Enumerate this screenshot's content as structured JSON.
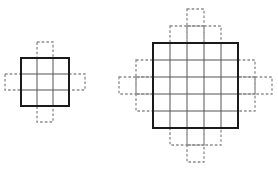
{
  "figure": {
    "title": "",
    "background_color": "#ffffff",
    "solid_border_color": "#1a1a1a",
    "interior_line_color": "#555555",
    "ghost_cell_color": "#8a8a8a",
    "ghost_dash_pattern": "2.6 2.1"
  },
  "chart_data": {
    "type": "diagram",
    "title": "",
    "panels": [
      {
        "id": "left-grid",
        "label": "",
        "grid": {
          "columns": 3,
          "rows": 3,
          "cell_size": 16,
          "origin_x": 21,
          "origin_y": 58
        },
        "ghost_cells": [
          {
            "col": 1,
            "row": -1
          },
          {
            "col": 1,
            "row": 3
          },
          {
            "col": -1,
            "row": 1
          },
          {
            "col": 3,
            "row": 1
          }
        ]
      },
      {
        "id": "right-grid",
        "label": "",
        "grid": {
          "columns": 5,
          "rows": 5,
          "cell_size": 17,
          "origin_x": 153,
          "origin_y": 43
        },
        "ghost_cells": [
          {
            "col": 1,
            "row": -1
          },
          {
            "col": 2,
            "row": -1
          },
          {
            "col": 3,
            "row": -1
          },
          {
            "col": 2,
            "row": -2
          },
          {
            "col": 1,
            "row": 5
          },
          {
            "col": 2,
            "row": 5
          },
          {
            "col": 3,
            "row": 5
          },
          {
            "col": 2,
            "row": 6
          },
          {
            "col": -1,
            "row": 1
          },
          {
            "col": -1,
            "row": 2
          },
          {
            "col": -1,
            "row": 3
          },
          {
            "col": -2,
            "row": 2
          },
          {
            "col": 5,
            "row": 1
          },
          {
            "col": 5,
            "row": 2
          },
          {
            "col": 5,
            "row": 3
          },
          {
            "col": 6,
            "row": 2
          }
        ]
      }
    ]
  }
}
